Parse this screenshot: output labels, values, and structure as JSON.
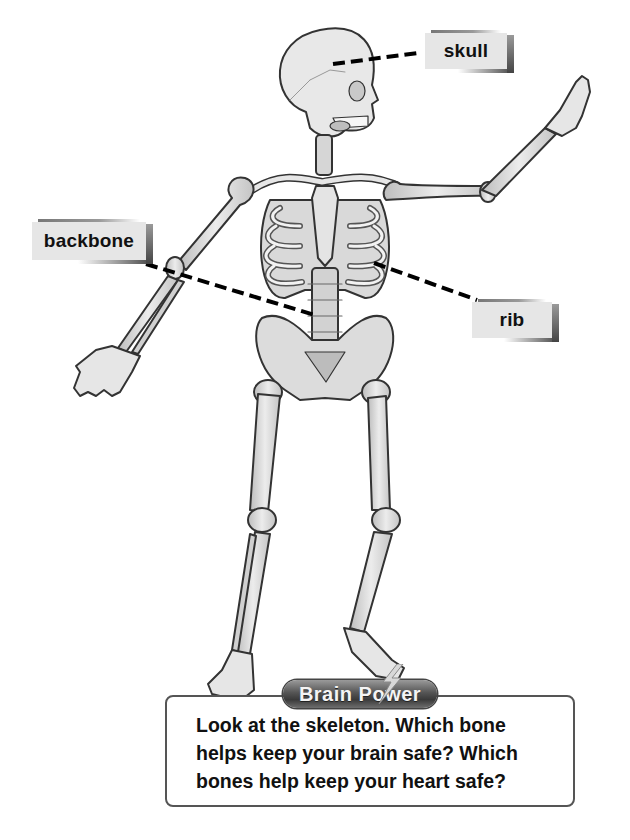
{
  "labels": {
    "skull": "skull",
    "backbone": "backbone",
    "rib": "rib"
  },
  "figure": {
    "icons": [
      "skeleton-illustration",
      "lightning-bolt-icon"
    ]
  },
  "brain_power": {
    "title": "Brain Power",
    "lines": [
      "Look at the skeleton. Which bone",
      "helps keep your brain safe? Which",
      "bones help keep your heart safe?"
    ]
  },
  "colors": {
    "bone_fill": "#e3e3e3",
    "bone_stroke": "#333333",
    "label_bg": "#e6e6e6",
    "leader_line": "#000000",
    "pill_dark": "#3a3a3a",
    "box_border": "#555555"
  }
}
